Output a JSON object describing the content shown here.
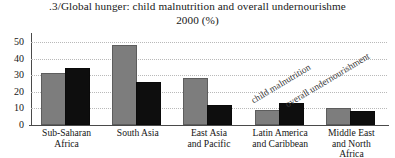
{
  "title": {
    "line1": ".3/Global hunger: child malnutrition and overall undernourishme",
    "line2": "2000 (%)"
  },
  "chart_data": {
    "type": "bar",
    "subtitle": "2000 (%)",
    "xlabel": "",
    "ylabel": "",
    "ylim": [
      0,
      55
    ],
    "yticks": [
      "0",
      "10",
      "20",
      "30",
      "40",
      "50"
    ],
    "grid": true,
    "legend_position": "inside-right-rotated",
    "categories": [
      "Sub-Saharan Africa",
      "South Asia",
      "East Asia and Pacific",
      "Latin America and Caribbean",
      "Middle East and North Africa"
    ],
    "category_lines": [
      [
        "Sub-Saharan",
        "Africa"
      ],
      [
        "South Asia"
      ],
      [
        "East Asia",
        "and Pacific"
      ],
      [
        "Latin America",
        "and Caribbean"
      ],
      [
        "Middle East",
        "and North",
        "Africa"
      ]
    ],
    "series": [
      {
        "name": "child malnutrition",
        "color": "#7d7d7d",
        "values": [
          30,
          47,
          27,
          8,
          9
        ]
      },
      {
        "name": "overall undernourishment",
        "color": "#0e0e0e",
        "values": [
          33,
          25,
          11,
          12,
          7
        ]
      }
    ]
  },
  "legend": {
    "child": "child malnutrition",
    "overall": "overall undernourishment"
  }
}
